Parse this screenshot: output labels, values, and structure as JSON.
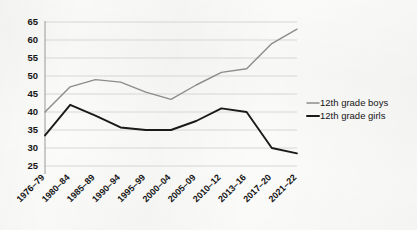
{
  "chart_data": {
    "type": "line",
    "title": "",
    "subtitle": "",
    "xlabel": "",
    "ylabel": "",
    "ylim": [
      25,
      65
    ],
    "yticks": [
      25,
      30,
      35,
      40,
      45,
      50,
      55,
      60,
      65
    ],
    "grid": true,
    "legend_position": "right",
    "categories": [
      "1976–79",
      "1980–84",
      "1985–89",
      "1990–94",
      "1995–99",
      "2000–04",
      "2005–09",
      "2010–12",
      "2013–16",
      "2017–20",
      "2021–22"
    ],
    "series": [
      {
        "name": "12th grade boys",
        "color": "#8c8c8c",
        "values": [
          40,
          47,
          49,
          48.3,
          45.5,
          43.5,
          47.5,
          51,
          52,
          59,
          63
        ]
      },
      {
        "name": "12th grade girls",
        "color": "#1a1a1a",
        "values": [
          33.5,
          42,
          39,
          35.7,
          35,
          35,
          37.5,
          41,
          40,
          30,
          28.5
        ]
      }
    ]
  },
  "legend": {
    "items": [
      {
        "label": "12th grade boys",
        "color": "#8c8c8c"
      },
      {
        "label": "12th grade girls",
        "color": "#1a1a1a"
      }
    ]
  },
  "colors": {
    "background": "#fbfbfa",
    "gridline": "#c9c9c9",
    "axis": "#8e8e8e",
    "boys_line": "#8c8c8c",
    "girls_line": "#1a1a1a",
    "text": "#151515"
  }
}
